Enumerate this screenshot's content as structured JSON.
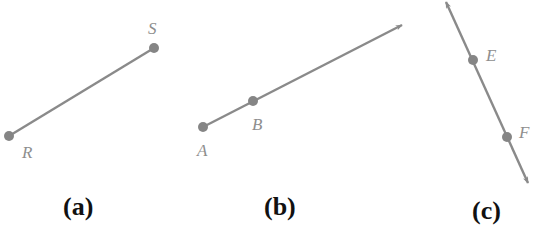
{
  "figure": {
    "colors": {
      "line": "#8a8a8a",
      "point": "#858585",
      "label": "#8e8e8e",
      "caption": "#111111"
    },
    "panels": [
      {
        "id": "a",
        "caption": "(a)",
        "kind": "segment",
        "description": "Line segment RS",
        "points": [
          {
            "name": "R",
            "x": 9,
            "y": 136,
            "label_x": 22,
            "label_y": 158
          },
          {
            "name": "S",
            "x": 154,
            "y": 48,
            "label_x": 148,
            "label_y": 34
          }
        ]
      },
      {
        "id": "b",
        "caption": "(b)",
        "kind": "ray",
        "description": "Ray AB",
        "points": [
          {
            "name": "A",
            "x": 203,
            "y": 127,
            "label_x": 197,
            "label_y": 156
          },
          {
            "name": "B",
            "x": 253,
            "y": 101,
            "label_x": 252,
            "label_y": 130
          }
        ],
        "arrow_tip": {
          "x": 402,
          "y": 25
        }
      },
      {
        "id": "c",
        "caption": "(c)",
        "kind": "line",
        "description": "Line EF",
        "points": [
          {
            "name": "E",
            "x": 473,
            "y": 60,
            "label_x": 486,
            "label_y": 61
          },
          {
            "name": "F",
            "x": 507,
            "y": 137,
            "label_x": 519,
            "label_y": 138
          }
        ],
        "arrow_tips": [
          {
            "x": 446,
            "y": 1
          },
          {
            "x": 528,
            "y": 183
          }
        ]
      }
    ]
  }
}
